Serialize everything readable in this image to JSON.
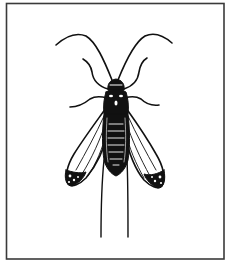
{
  "figure": {
    "colors": {
      "background": "#ffffff",
      "border": "#3a3a3a",
      "ink": "#111111"
    },
    "caption": ""
  }
}
